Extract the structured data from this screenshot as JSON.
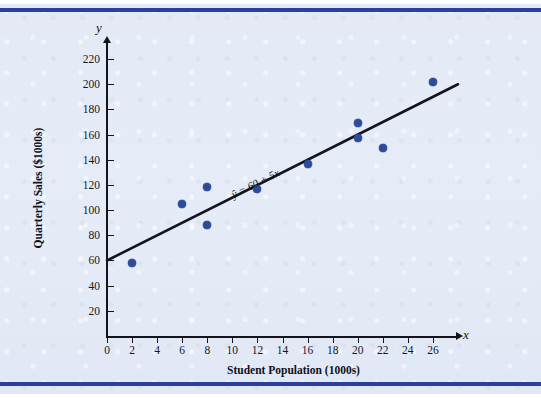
{
  "figure": {
    "background_color": "#e4ebf6",
    "rule_color": "#2b3f9e",
    "point_color": "#2c4b9b",
    "line_color": "#14141e"
  },
  "chart_data": {
    "type": "scatter",
    "title": "",
    "xlabel": "Student Population (1000s)",
    "ylabel": "Quarterly Sales ($1000s)",
    "x_axis_variable": "x",
    "y_axis_variable": "y",
    "xlim": [
      0,
      28
    ],
    "ylim": [
      0,
      232
    ],
    "xticks": [
      0,
      2,
      4,
      6,
      8,
      10,
      12,
      14,
      16,
      18,
      20,
      22,
      24,
      26
    ],
    "xtick_labels": [
      "0",
      "2",
      "4",
      "6",
      "8",
      "10",
      "12",
      "14",
      "16",
      "18",
      "20",
      "22",
      "24",
      "26"
    ],
    "yticks": [
      20,
      40,
      60,
      80,
      100,
      120,
      140,
      160,
      180,
      200,
      220
    ],
    "ytick_labels": [
      "20",
      "40",
      "60",
      "80",
      "100",
      "120",
      "140",
      "160",
      "180",
      "200",
      "220"
    ],
    "grid": false,
    "legend": "none",
    "x": [
      2,
      6,
      8,
      8,
      12,
      16,
      20,
      20,
      22,
      26
    ],
    "y": [
      58,
      105,
      88,
      118,
      117,
      137,
      157,
      169,
      149,
      202
    ],
    "points": [
      {
        "x": 2,
        "y": 58
      },
      {
        "x": 6,
        "y": 105
      },
      {
        "x": 8,
        "y": 88
      },
      {
        "x": 8,
        "y": 118
      },
      {
        "x": 12,
        "y": 117
      },
      {
        "x": 16,
        "y": 137
      },
      {
        "x": 20,
        "y": 157
      },
      {
        "x": 20,
        "y": 169
      },
      {
        "x": 22,
        "y": 149
      },
      {
        "x": 26,
        "y": 202
      }
    ],
    "fit_line": {
      "equation_text": "ŷ = 60 + 5x",
      "intercept": 60,
      "slope": 5,
      "x_start": 0,
      "x_end": 28,
      "y_start": 60,
      "y_end": 200
    }
  }
}
